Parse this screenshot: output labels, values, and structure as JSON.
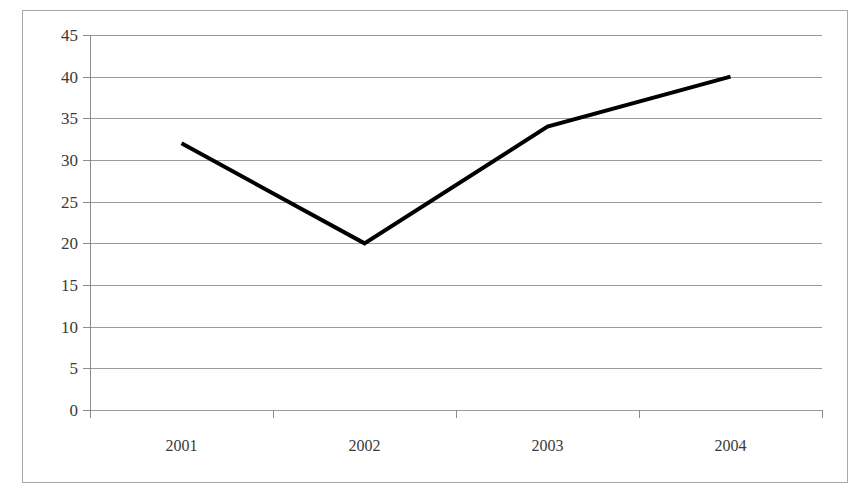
{
  "chart_data": {
    "type": "line",
    "title": "",
    "subtitle": "",
    "xlabel": "",
    "ylabel": "",
    "categories": [
      "2001",
      "2002",
      "2003",
      "2004"
    ],
    "values": [
      32,
      20,
      34,
      40
    ],
    "series": [
      {
        "name": "",
        "values": [
          32,
          20,
          34,
          40
        ]
      }
    ],
    "ylim": [
      0,
      45
    ],
    "y_ticks": [
      0,
      5,
      10,
      15,
      20,
      25,
      30,
      35,
      40,
      45
    ],
    "y_tick_labels": [
      "0",
      "5",
      "10",
      "15",
      "20",
      "25",
      "30",
      "35",
      "40",
      "45"
    ],
    "x_tick_labels": [
      "2001",
      "2002",
      "2003",
      "2004"
    ],
    "grid": true,
    "grid_axis": "y",
    "legend": false,
    "legend_position": "none",
    "markers": false,
    "line_color": "#000000",
    "line_width": 4,
    "grid_color": "#9b9b9b",
    "axis_color": "#8c8c8c",
    "background_color": "#ffffff",
    "border_color": "#a9a9a9",
    "annotations": []
  }
}
